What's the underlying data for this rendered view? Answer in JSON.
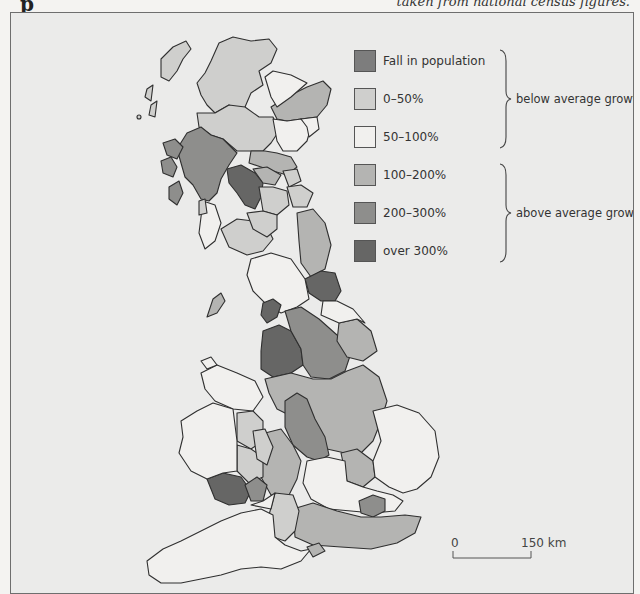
{
  "captions": {
    "top_right_partial": "taken from national census figures.",
    "top_left_partial": "p"
  },
  "legend": {
    "items": [
      {
        "label": "Fall in population",
        "color": "#7d7d7d",
        "category": "fall"
      },
      {
        "label": "0–50%",
        "color": "#cfcfcd",
        "category": "0-50"
      },
      {
        "label": "50–100%",
        "color": "#f1f0ee",
        "category": "50-100"
      },
      {
        "label": "100–200%",
        "color": "#b4b4b2",
        "category": "100-200"
      },
      {
        "label": "200–300%",
        "color": "#8e8e8c",
        "category": "200-300"
      },
      {
        "label": "over 300%",
        "color": "#666665",
        "category": "over-300"
      }
    ],
    "groups": [
      {
        "label": "below average growth",
        "covers": [
          "Fall in population",
          "0–50%",
          "50–100%"
        ]
      },
      {
        "label": "above average growth",
        "covers": [
          "100–200%",
          "200–300%",
          "over 300%"
        ]
      }
    ]
  },
  "scale": {
    "start_label": "0",
    "end_label": "150 km"
  },
  "colors": {
    "background": "#ebebea",
    "outline": "#2f2f2f",
    "land_unshaded": "#f1f0ee"
  },
  "map": {
    "subject": "Great Britain population growth by region (choropleth)",
    "note": "Region shapes are hand-approximated; IDs are descriptive placeholders, not official region names.",
    "regions": [
      {
        "id": "scotland-north-islands",
        "category": "0-50"
      },
      {
        "id": "scotland-north-highlands",
        "category": "0-50"
      },
      {
        "id": "scotland-northeast-coast",
        "category": "100-200"
      },
      {
        "id": "scotland-east-small",
        "category": "50-100"
      },
      {
        "id": "scotland-central-north",
        "category": "0-50"
      },
      {
        "id": "scotland-east-coast",
        "category": "50-100"
      },
      {
        "id": "scotland-west-highlands-islands",
        "category": "200-300"
      },
      {
        "id": "scotland-central-belt-west",
        "category": "over-300"
      },
      {
        "id": "scotland-central-belt-east",
        "category": "100-200"
      },
      {
        "id": "scotland-borders-west",
        "category": "0-50"
      },
      {
        "id": "scotland-borders-east",
        "category": "0-50"
      },
      {
        "id": "england-northeast-coast",
        "category": "100-200"
      },
      {
        "id": "england-northeast-industrial",
        "category": "over-300"
      },
      {
        "id": "england-northwest-cumbria",
        "category": "50-100"
      },
      {
        "id": "england-northwest-lancashire",
        "category": "over-300"
      },
      {
        "id": "england-yorkshire-west",
        "category": "200-300"
      },
      {
        "id": "england-yorkshire-east",
        "category": "100-200"
      },
      {
        "id": "england-midlands-east",
        "category": "100-200"
      },
      {
        "id": "england-midlands-west",
        "category": "200-300"
      },
      {
        "id": "england-east-anglia",
        "category": "50-100"
      },
      {
        "id": "wales-north",
        "category": "50-100"
      },
      {
        "id": "wales-mid-border",
        "category": "0-50"
      },
      {
        "id": "wales-south-industrial",
        "category": "over-300"
      },
      {
        "id": "england-southwest",
        "category": "50-100"
      },
      {
        "id": "england-south-central",
        "category": "0-50"
      },
      {
        "id": "england-southeast",
        "category": "100-200"
      },
      {
        "id": "england-london",
        "category": "200-300"
      },
      {
        "id": "isle-of-man",
        "category": "100-200"
      },
      {
        "id": "isle-of-wight",
        "category": "100-200"
      }
    ]
  }
}
